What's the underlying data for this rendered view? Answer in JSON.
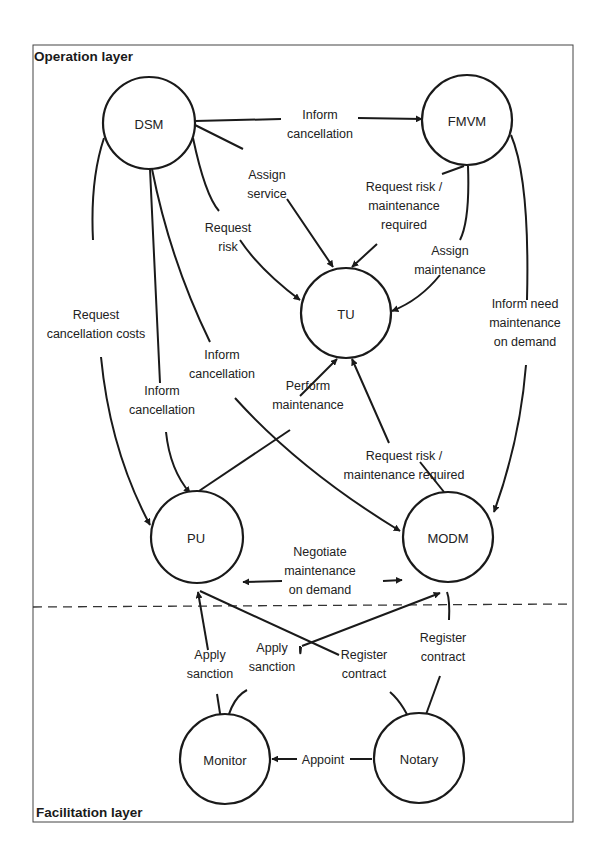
{
  "layers": {
    "operation": "Operation layer",
    "facilitation": "Facilitation layer"
  },
  "nodes": {
    "dsm": "DSM",
    "fmvm": "FMVM",
    "tu": "TU",
    "pu": "PU",
    "modm": "MODM",
    "monitor": "Monitor",
    "notary": "Notary"
  },
  "edges": {
    "dsm_fmvm": [
      "Inform",
      "cancellation"
    ],
    "dsm_tu_assign": [
      "Assign",
      "service"
    ],
    "dsm_tu_risk": [
      "Request",
      "risk"
    ],
    "fmvm_tu_risk": [
      "Request risk  /",
      "maintenance",
      "required"
    ],
    "fmvm_tu_assign": [
      "Assign",
      "maintenance"
    ],
    "dsm_pu_costs": [
      "Request",
      "cancellation costs"
    ],
    "dsm_pu_inform": [
      "Inform",
      "cancellation"
    ],
    "dsm_modm_inform": [
      "Inform",
      "cancellation"
    ],
    "fmvm_modm": [
      "Inform need",
      "maintenance",
      "on demand"
    ],
    "pu_tu": [
      "Perform",
      "maintenance"
    ],
    "modm_tu": [
      "Request risk  /",
      "maintenance required"
    ],
    "pu_modm": [
      "Negotiate",
      "maintenance",
      "on demand"
    ],
    "monitor_pu": [
      "Apply",
      "sanction"
    ],
    "monitor_modm": [
      "Apply",
      "sanction"
    ],
    "pu_notary": [
      "Register",
      "contract"
    ],
    "modm_notary": [
      "Register",
      "contract"
    ],
    "notary_monitor": [
      "Appoint"
    ]
  }
}
